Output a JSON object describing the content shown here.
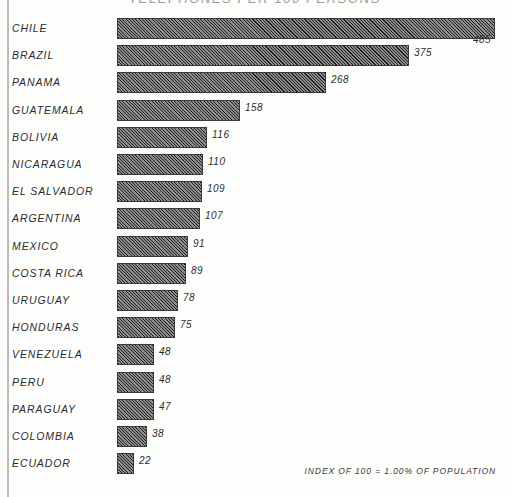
{
  "chart_data": {
    "type": "bar",
    "orientation": "horizontal",
    "title": "TELEPHONES PER 100 PERSONS",
    "footnote": "INDEX OF 100 = 1.00% OF POPULATION",
    "xlabel": "",
    "ylabel": "",
    "grid": false,
    "legend": "none",
    "xlim": [
      0,
      485
    ],
    "categories": [
      "CHILE",
      "BRAZIL",
      "PANAMA",
      "GUATEMALA",
      "BOLIVIA",
      "NICARAGUA",
      "EL SALVADOR",
      "ARGENTINA",
      "MEXICO",
      "COSTA RICA",
      "URUGUAY",
      "HONDURAS",
      "VENEZUELA",
      "PERU",
      "PARAGUAY",
      "COLOMBIA",
      "ECUADOR"
    ],
    "values": [
      485,
      375,
      268,
      158,
      116,
      110,
      109,
      107,
      91,
      89,
      78,
      75,
      48,
      48,
      47,
      38,
      22
    ],
    "value_labels": [
      "485",
      "375",
      "268",
      "158",
      "116",
      "110",
      "109",
      "107",
      "91",
      "89",
      "78",
      "75",
      "48",
      "48",
      "47",
      "38",
      "22"
    ],
    "bar_fill": "#8e8e8e",
    "bar_hatch": "diagonal-45",
    "bar_edge_color": "#3a3a3a",
    "background_color": "#fdfdfc",
    "text_color": "#2b2b2b"
  }
}
